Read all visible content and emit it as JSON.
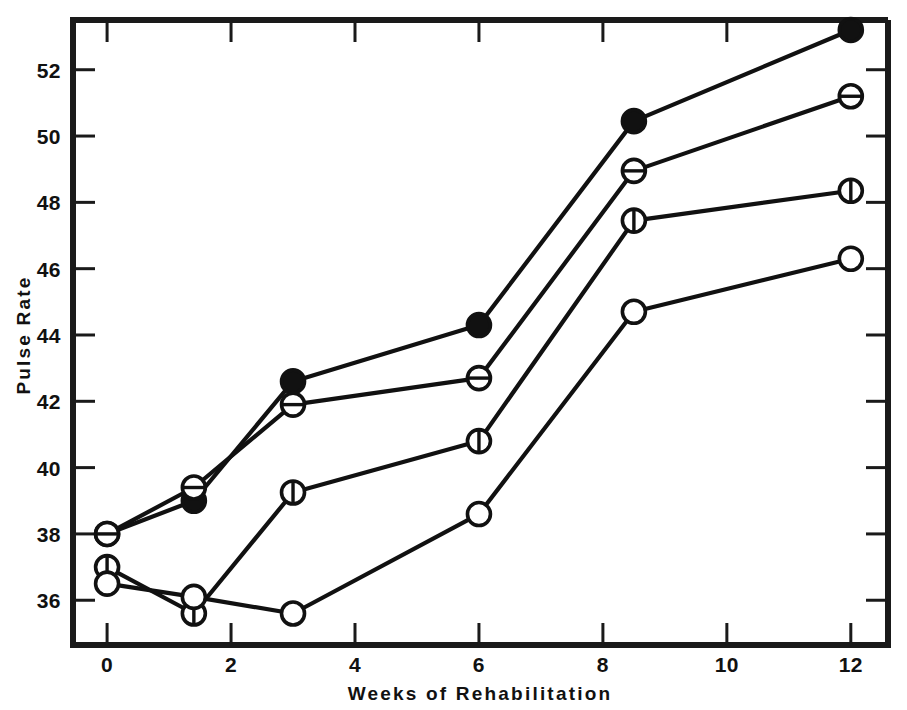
{
  "chart_data": {
    "type": "line",
    "title": "",
    "xlabel": "Weeks  of  Rehabilitation",
    "ylabel": "Pulse  Rate",
    "x": [
      0,
      1.4,
      3,
      6,
      8.5,
      12
    ],
    "xlim": [
      -0.55,
      12.6
    ],
    "ylim": [
      34.65,
      53.5
    ],
    "xticks": [
      0,
      2,
      4,
      6,
      8,
      10,
      12
    ],
    "xtick_labels": [
      "0",
      "2",
      "4",
      "6",
      "8",
      "10",
      "12"
    ],
    "yticks": [
      36,
      38,
      40,
      42,
      44,
      46,
      48,
      50,
      52
    ],
    "ytick_labels": [
      "36",
      "38",
      "40",
      "42",
      "44",
      "46",
      "48",
      "50",
      "52"
    ],
    "grid": false,
    "legend": "none",
    "series": [
      {
        "name": "filled-circle-series",
        "marker": "filled-circle",
        "marker_symbol": "●",
        "color": "#111111",
        "values": [
          38.0,
          39.0,
          42.6,
          44.3,
          50.45,
          53.2
        ]
      },
      {
        "name": "horizontal-bar-circle-series",
        "marker": "circle-with-horizontal-bar",
        "marker_symbol": "⊖",
        "color": "#111111",
        "values": [
          38.0,
          39.4,
          41.9,
          42.7,
          48.95,
          51.2
        ]
      },
      {
        "name": "vertical-bar-circle-series",
        "marker": "circle-with-vertical-bar",
        "marker_symbol": "⌀",
        "color": "#111111",
        "values": [
          37.0,
          35.6,
          39.25,
          40.8,
          47.45,
          48.35
        ]
      },
      {
        "name": "open-circle-series",
        "marker": "open-circle",
        "marker_symbol": "○",
        "color": "#111111",
        "values": [
          36.5,
          36.1,
          35.6,
          38.6,
          44.7,
          46.3
        ]
      }
    ]
  },
  "axes": {
    "x_title": "Weeks  of  Rehabilitation",
    "y_title": "Pulse  Rate"
  },
  "colors": {
    "ink": "#111111",
    "frame": "#1a1a1a",
    "background": "#ffffff"
  }
}
